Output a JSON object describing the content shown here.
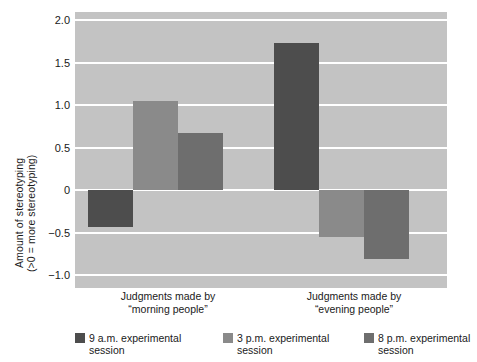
{
  "chart_data": {
    "type": "bar",
    "title": "",
    "xlabel": "",
    "ylabel_line1": "Amount of stereotyping",
    "ylabel_line2": "(>0 = more stereotyping)",
    "ylim": [
      -1.15,
      2.1
    ],
    "yticks": [
      2.0,
      1.5,
      1.0,
      0.5,
      0,
      -0.5,
      -1.0
    ],
    "ytick_labels": [
      "2.0",
      "1.5",
      "1.0",
      "0.5",
      "0",
      "−0.5",
      "−1.0"
    ],
    "grid": true,
    "grid_color": "#ffffff",
    "plot_background": "#c3c3c3",
    "legend_position": "bottom",
    "categories": [
      {
        "line1": "Judgments made by",
        "line2": "“morning people”"
      },
      {
        "line1": "Judgments made by",
        "line2": "“evening people”"
      }
    ],
    "series": [
      {
        "name": "9 a.m. experimental session",
        "legend_line1": "9 a.m. experimental",
        "legend_line2": "session",
        "color": "#4d4d4d",
        "values": [
          -0.43,
          1.73
        ]
      },
      {
        "name": "3 p.m. experimental session",
        "legend_line1": "3 p.m. experimental",
        "legend_line2": "session",
        "color": "#8a8a8a",
        "values": [
          1.05,
          -0.55
        ]
      },
      {
        "name": "8 p.m. experimental session",
        "legend_line1": "8 p.m. experimental",
        "legend_line2": "session",
        "color": "#6e6e6e",
        "values": [
          0.68,
          -0.81
        ]
      }
    ]
  }
}
